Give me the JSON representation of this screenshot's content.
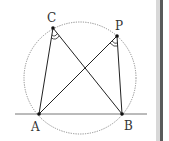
{
  "diagram": {
    "type": "geometry",
    "circle": {
      "cx": 80,
      "cy": 78,
      "r": 56,
      "style": "dotted",
      "color": "#8a8a8a"
    },
    "baseline": {
      "x1": 15,
      "y1": 114,
      "x2": 147,
      "y2": 114,
      "color": "#777777"
    },
    "points": [
      {
        "name": "A",
        "x": 39,
        "y": 114,
        "label_x": 31,
        "label_y": 131
      },
      {
        "name": "B",
        "x": 122,
        "y": 114,
        "label_x": 124,
        "label_y": 130
      },
      {
        "name": "C",
        "x": 53,
        "y": 28,
        "label_x": 47,
        "label_y": 22
      },
      {
        "name": "P",
        "x": 117,
        "y": 36,
        "label_x": 115,
        "label_y": 30
      }
    ],
    "segments": [
      [
        "C",
        "A"
      ],
      [
        "C",
        "B"
      ],
      [
        "P",
        "A"
      ],
      [
        "P",
        "B"
      ]
    ],
    "angle_marks": [
      {
        "vertex": "C",
        "rays": [
          "A",
          "B"
        ],
        "style": "double-arc"
      },
      {
        "vertex": "P",
        "rays": [
          "A",
          "B"
        ],
        "style": "double-arc"
      }
    ],
    "labels": {
      "A": "A",
      "B": "B",
      "C": "C",
      "P": "P"
    },
    "line_color": "#222222",
    "scrollbar_color": "#5a5a5a"
  }
}
